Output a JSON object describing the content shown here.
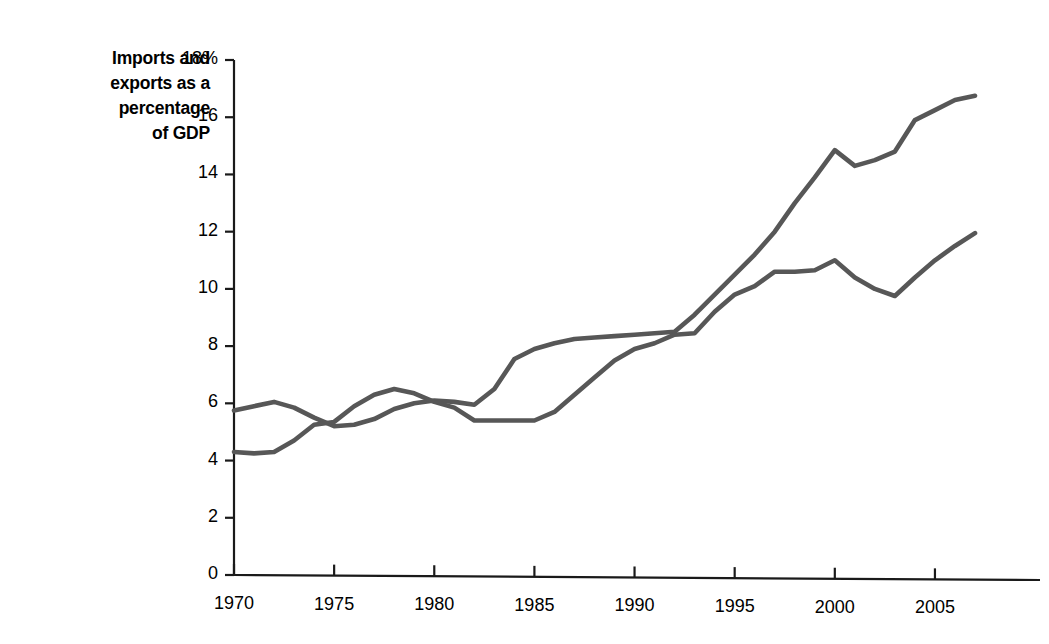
{
  "chart_data": {
    "type": "line",
    "title": "",
    "ylabel": "Imports and exports as a percentage of GDP",
    "ylabel_lines": [
      "Imports and",
      "exports as a",
      "percentage",
      "of GDP"
    ],
    "xlabel": "",
    "ylim": [
      0,
      18
    ],
    "xlim": [
      1970,
      2007
    ],
    "grid": false,
    "legend": "none",
    "ytick_labels": [
      "18%",
      "16",
      "14",
      "12",
      "10",
      "8",
      "6",
      "4",
      "2",
      "0"
    ],
    "ytick_values": [
      18,
      16,
      14,
      12,
      10,
      8,
      6,
      4,
      2,
      0
    ],
    "xtick_labels": [
      "1970",
      "1975",
      "1980",
      "1985",
      "1990",
      "1995",
      "2000",
      "2005"
    ],
    "xtick_values": [
      1970,
      1975,
      1980,
      1985,
      1990,
      1995,
      2000,
      2005
    ],
    "x": [
      1970,
      1971,
      1972,
      1973,
      1974,
      1975,
      1976,
      1977,
      1978,
      1979,
      1980,
      1981,
      1982,
      1983,
      1984,
      1985,
      1986,
      1987,
      1988,
      1989,
      1990,
      1991,
      1992,
      1993,
      1994,
      1995,
      1996,
      1997,
      1998,
      1999,
      2000,
      2001,
      2002,
      2003,
      2004,
      2005,
      2006,
      2007
    ],
    "series": [
      {
        "name": "Exports",
        "color": "#575757",
        "values": [
          5.75,
          5.9,
          6.05,
          5.85,
          5.5,
          5.2,
          5.25,
          5.45,
          5.8,
          6.0,
          6.1,
          6.05,
          5.95,
          6.5,
          7.55,
          7.9,
          8.1,
          8.25,
          8.3,
          8.35,
          8.4,
          8.45,
          8.5,
          9.1,
          9.8,
          10.5,
          11.2,
          12.0,
          13.0,
          13.9,
          14.85,
          14.3,
          14.5,
          14.8,
          15.9,
          16.25,
          16.6,
          16.75
        ]
      },
      {
        "name": "Imports",
        "color": "#575757",
        "values": [
          4.3,
          4.25,
          4.3,
          4.7,
          5.25,
          5.35,
          5.9,
          6.3,
          6.5,
          6.35,
          6.05,
          5.85,
          5.4,
          5.4,
          5.4,
          5.4,
          5.7,
          6.3,
          6.9,
          7.5,
          7.9,
          8.1,
          8.4,
          8.45,
          9.2,
          9.8,
          10.1,
          10.6,
          10.6,
          10.65,
          11.0,
          10.4,
          10.0,
          9.75,
          10.4,
          11.0,
          11.5,
          11.95
        ]
      }
    ]
  },
  "axis": {
    "y_axis_name": "vertical-axis",
    "x_axis_name": "horizontal-axis"
  }
}
